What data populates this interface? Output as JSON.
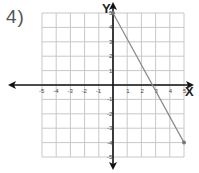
{
  "problem_number": "4)",
  "chart_data": {
    "type": "line",
    "title": "",
    "xlabel": "X",
    "ylabel": "Y",
    "xlim": [
      -5,
      5
    ],
    "ylim": [
      -5,
      5
    ],
    "grid": true,
    "x_ticks": [
      "-5",
      "-4",
      "-3",
      "-2",
      "-1",
      "1",
      "2",
      "3",
      "4",
      "5"
    ],
    "y_ticks": [
      "5",
      "4",
      "3",
      "2",
      "1",
      "-1",
      "-2",
      "-3",
      "-4",
      "-5"
    ],
    "series": [
      {
        "name": "line segment",
        "points": [
          [
            0,
            5
          ],
          [
            5,
            -4
          ]
        ],
        "color": "#888888"
      }
    ],
    "endpoints": [
      [
        0,
        5
      ],
      [
        5,
        -4
      ]
    ]
  },
  "colors": {
    "grid": "#c8c8c8",
    "axis": "#111111",
    "line": "#888888"
  }
}
